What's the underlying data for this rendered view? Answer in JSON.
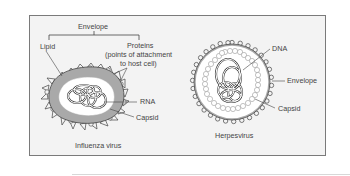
{
  "figure": {
    "influenza": {
      "caption": "Influenza virus",
      "labels": {
        "envelope": "Envelope",
        "lipid": "Lipid",
        "proteins_line1": "Proteins",
        "proteins_line2": "(points of attachment",
        "proteins_line3": "to host cell)",
        "rna": "RNA",
        "capsid": "Capsid"
      }
    },
    "herpesvirus": {
      "caption": "Herpesvirus",
      "labels": {
        "dna": "DNA",
        "envelope": "Envelope",
        "capsid": "Capsid"
      }
    }
  },
  "colors": {
    "box_bg": "#f3f3f3",
    "box_border": "#7a7a7a",
    "envelope_gray": "#a9a9a9",
    "line": "#444444"
  }
}
